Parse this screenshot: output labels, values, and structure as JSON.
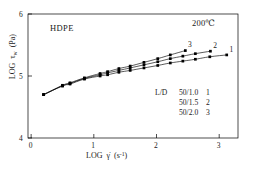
{
  "figure": {
    "background_color": "#ffffff",
    "line_color": "#000000",
    "marker_color": "#000000"
  },
  "annotations": {
    "material": "HDPE",
    "temperature": "200℃"
  },
  "legend": {
    "title": "L/D",
    "entries": [
      {
        "ratio": "50/1.0",
        "number": "1"
      },
      {
        "ratio": "50/1.5",
        "number": "2"
      },
      {
        "ratio": "50/2.0",
        "number": "3"
      }
    ]
  },
  "axes": {
    "x": {
      "label_main": "LOG",
      "label_symbol": "γ̇",
      "label_units_open": "(s",
      "label_units_exp": "-1",
      "label_units_close": ")",
      "ticks": [
        "0",
        "1",
        "2",
        "3"
      ],
      "tick_values": [
        0,
        1,
        2,
        3
      ],
      "min": -0.05,
      "max": 3.3
    },
    "y": {
      "label_main": "LOG",
      "label_symbol": "τ",
      "label_subscript": "w",
      "label_units": "(Pa)",
      "ticks": [
        "4",
        "5",
        "6"
      ],
      "tick_values": [
        4,
        5,
        6
      ],
      "min": 4,
      "max": 6
    }
  },
  "curve_tags": [
    {
      "label": "1",
      "x": 3.18,
      "y": 5.34
    },
    {
      "label": "2",
      "x": 2.92,
      "y": 5.41
    },
    {
      "label": "3",
      "x": 2.52,
      "y": 5.42
    }
  ],
  "chart_data": {
    "type": "line",
    "title": "",
    "subtitle": "",
    "xlabel": "LOG γ̇ (s⁻¹)",
    "ylabel": "LOG τw (Pa)",
    "xlim": [
      -0.05,
      3.3
    ],
    "ylim": [
      4,
      6
    ],
    "xticks": [
      0,
      1,
      2,
      3
    ],
    "yticks": [
      4,
      5,
      6
    ],
    "grid": false,
    "legend_position": "inside-lower-right",
    "marker": "filled-square",
    "annotations": [
      "HDPE",
      "200℃"
    ],
    "series": [
      {
        "name": "1",
        "legend": "L/D 50/1.0",
        "x": [
          0.2,
          0.5,
          0.62,
          0.85,
          1.1,
          1.22,
          1.4,
          1.58,
          1.8,
          2.02,
          2.22,
          2.42,
          2.62,
          2.85,
          3.12
        ],
        "y": [
          4.7,
          4.84,
          4.87,
          4.95,
          5.0,
          5.02,
          5.06,
          5.09,
          5.13,
          5.17,
          5.21,
          5.24,
          5.27,
          5.31,
          5.34
        ]
      },
      {
        "name": "2",
        "legend": "L/D 50/1.5",
        "x": [
          0.2,
          0.5,
          0.62,
          0.85,
          1.1,
          1.22,
          1.4,
          1.58,
          1.8,
          2.02,
          2.22,
          2.42,
          2.62,
          2.86
        ],
        "y": [
          4.7,
          4.84,
          4.88,
          4.96,
          5.02,
          5.05,
          5.09,
          5.13,
          5.18,
          5.23,
          5.28,
          5.32,
          5.36,
          5.4
        ]
      },
      {
        "name": "3",
        "legend": "L/D 50/2.0",
        "x": [
          0.2,
          0.5,
          0.62,
          0.85,
          1.1,
          1.22,
          1.4,
          1.58,
          1.8,
          2.02,
          2.22,
          2.46
        ],
        "y": [
          4.7,
          4.85,
          4.89,
          4.97,
          5.04,
          5.07,
          5.12,
          5.16,
          5.22,
          5.28,
          5.34,
          5.41
        ]
      }
    ]
  }
}
